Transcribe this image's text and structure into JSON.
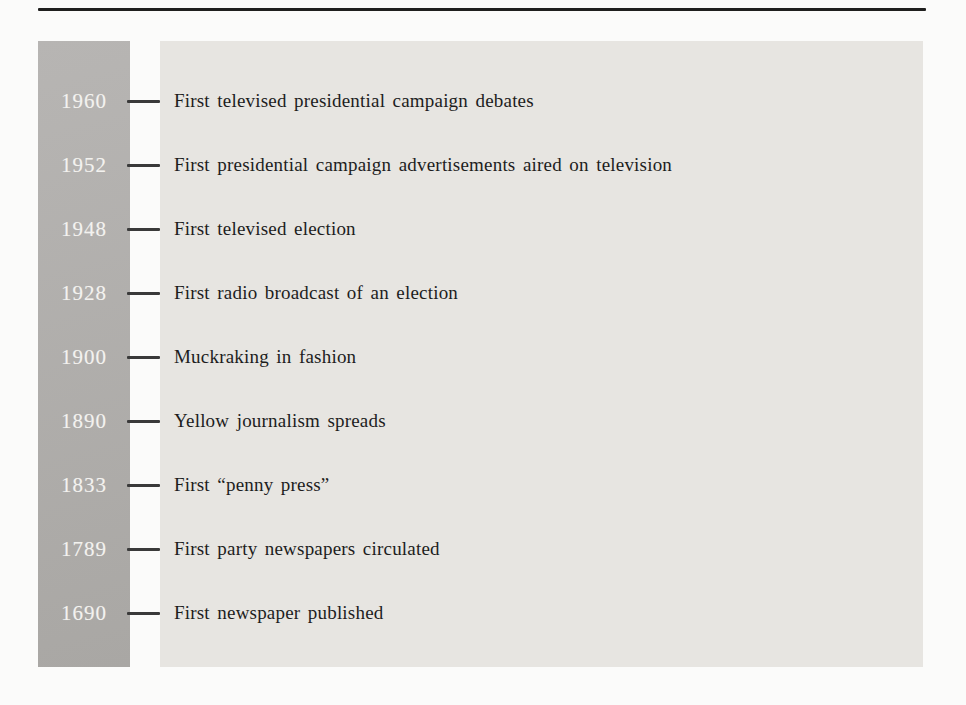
{
  "page": {
    "background_color": "#fbfbfa",
    "rule_color": "#1f1f1e"
  },
  "timeline": {
    "year_bar_color_light": "#b7b5b3",
    "year_bar_color_dark": "#a9a7a4",
    "panel_color": "#e7e5e1",
    "year_text_color": "#f3f2ef",
    "event_text_color": "#1d1d1d",
    "tick_color": "#3a3a3a",
    "entries": [
      {
        "year": "1960",
        "event": "First televised presidential campaign debates"
      },
      {
        "year": "1952",
        "event": "First presidential campaign advertisements aired on television"
      },
      {
        "year": "1948",
        "event": "First televised election"
      },
      {
        "year": "1928",
        "event": "First radio broadcast of an election"
      },
      {
        "year": "1900",
        "event": "Muckraking in fashion"
      },
      {
        "year": "1890",
        "event": "Yellow journalism spreads"
      },
      {
        "year": "1833",
        "event": "First “penny press”"
      },
      {
        "year": "1789",
        "event": "First party newspapers circulated"
      },
      {
        "year": "1690",
        "event": "First newspaper published"
      }
    ]
  }
}
